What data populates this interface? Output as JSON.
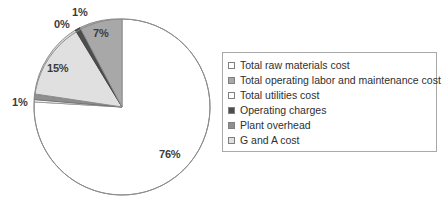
{
  "chart_data": {
    "type": "pie",
    "title": "",
    "categories": [
      "Total raw materials cost",
      "Total operating labor and maintenance cost",
      "Total utilities cost",
      "Operating charges",
      "Plant overhead",
      "G and A cost"
    ],
    "values": [
      76,
      7,
      1,
      0,
      1,
      15
    ],
    "data_labels": [
      "76%",
      "7%",
      "1%",
      "0%",
      "1%",
      "15%"
    ],
    "colors": [
      "#ffffff",
      "#a8a8a8",
      "#6e6e6e",
      "#ffffff",
      "#8f8f8f",
      "#d9d9d9"
    ],
    "legend_position": "right",
    "grid": false,
    "start_angle_deg": 0,
    "direction": "counterclockwise"
  },
  "pie": {
    "labels": [
      {
        "id": "label-76",
        "text": "76%",
        "left": 159,
        "top": 148
      },
      {
        "id": "label-7",
        "text": "7%",
        "left": 93,
        "top": 27
      },
      {
        "id": "label-1-top",
        "text": "1%",
        "left": 72,
        "top": 6
      },
      {
        "id": "label-0",
        "text": "0%",
        "left": 54,
        "top": 18
      },
      {
        "id": "label-15",
        "text": "15%",
        "left": 47,
        "top": 62
      },
      {
        "id": "label-1-left",
        "text": "1%",
        "left": 12,
        "top": 96
      }
    ]
  },
  "legend": {
    "items": [
      {
        "label": "Total raw materials cost",
        "swatch": "#ffffff",
        "swatch_name": "legend-swatch-raw-materials"
      },
      {
        "label": "Total operating labor and maintenance cost",
        "swatch": "#a8a8a8",
        "swatch_name": "legend-swatch-operating-labor"
      },
      {
        "label": "Total utilities cost",
        "swatch": "#ffffff",
        "swatch_name": "legend-swatch-utilities"
      },
      {
        "label": "Operating charges",
        "swatch": "#4d4d4d",
        "swatch_name": "legend-swatch-operating-charges"
      },
      {
        "label": "Plant overhead",
        "swatch": "#8f8f8f",
        "swatch_name": "legend-swatch-plant-overhead"
      },
      {
        "label": "G and A cost",
        "swatch": "#e0e0e0",
        "swatch_name": "legend-swatch-g-and-a"
      }
    ]
  }
}
